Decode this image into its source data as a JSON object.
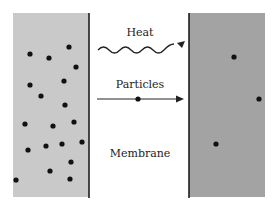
{
  "diagram": {
    "labels": {
      "heat": "Heat",
      "particles": "Particles",
      "membrane": "Membrane"
    },
    "colors": {
      "left_region": "#c9c9c9",
      "right_region": "#a3a3a3",
      "membrane_line": "#111111",
      "particle": "#111111",
      "arrow": "#222222"
    },
    "left_region": {
      "description": "high concentration",
      "particle_count": 19
    },
    "right_region": {
      "description": "low concentration",
      "particle_count": 3
    }
  }
}
